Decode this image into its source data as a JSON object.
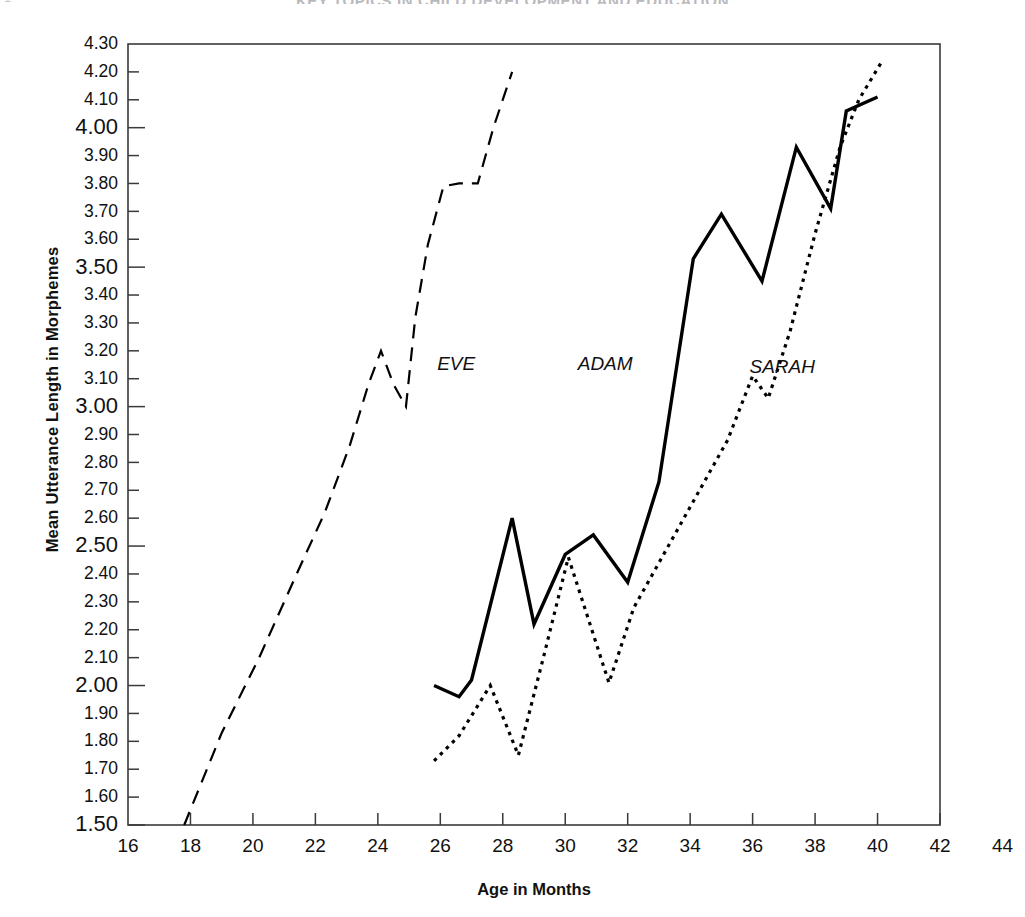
{
  "page": {
    "running_header": "KEY TOPICS IN CHILD DEVELOPMENT AND EDUCATION",
    "page_number": "1"
  },
  "chart_data": {
    "type": "line",
    "title": "",
    "xlabel": "Age in Months",
    "ylabel": "Mean Utterance Length in Morphemes",
    "xlim": [
      16,
      44
    ],
    "ylim": [
      1.5,
      4.3
    ],
    "grid": false,
    "legend_position": "inline-annotations",
    "x_ticks": [
      16,
      18,
      20,
      22,
      24,
      26,
      28,
      30,
      32,
      34,
      36,
      38,
      40,
      42,
      44
    ],
    "x_tick_labels": [
      "16",
      "18",
      "20",
      "22",
      "24",
      "26",
      "28",
      "30",
      "32",
      "34",
      "36",
      "38",
      "40",
      "42",
      "44"
    ],
    "y_ticks": [
      1.5,
      1.6,
      1.7,
      1.8,
      1.9,
      2.0,
      2.1,
      2.2,
      2.3,
      2.4,
      2.5,
      2.6,
      2.7,
      2.8,
      2.9,
      3.0,
      3.1,
      3.2,
      3.3,
      3.4,
      3.5,
      3.6,
      3.7,
      3.8,
      3.9,
      4.0,
      4.1,
      4.2,
      4.3
    ],
    "y_tick_labels": [
      "1.50",
      "1.60",
      "1.70",
      "1.80",
      "1.90",
      "2.00",
      "2.10",
      "2.20",
      "2.30",
      "2.40",
      "2.50",
      "2.60",
      "2.70",
      "2.80",
      "2.90",
      "3.00",
      "3.10",
      "3.20",
      "3.30",
      "3.40",
      "3.50",
      "3.60",
      "3.70",
      "3.80",
      "3.90",
      "4.00",
      "4.10",
      "4.20",
      "4.30"
    ],
    "y_major_labels": [
      "1.50",
      "2.00",
      "2.50",
      "3.00",
      "3.50",
      "4.00"
    ],
    "series": [
      {
        "name": "EVE",
        "style": "dashed",
        "color": "#000000",
        "label_x": 25.9,
        "label_y": 3.15,
        "x": [
          17.8,
          19.0,
          20.2,
          21.4,
          22.3,
          23.1,
          23.7,
          24.1,
          24.5,
          24.9,
          25.2,
          25.6,
          26.1,
          26.6,
          27.2,
          27.7,
          28.3
        ],
        "y": [
          1.5,
          1.83,
          2.1,
          2.4,
          2.62,
          2.86,
          3.08,
          3.2,
          3.08,
          3.0,
          3.32,
          3.58,
          3.79,
          3.8,
          3.8,
          4.0,
          4.2
        ]
      },
      {
        "name": "ADAM",
        "style": "solid",
        "color": "#000000",
        "label_x": 30.4,
        "label_y": 3.15,
        "x": [
          25.8,
          26.6,
          27.0,
          28.3,
          29.0,
          30.0,
          30.9,
          32.0,
          33.0,
          34.1,
          35.0,
          36.3,
          37.4,
          38.5,
          39.0,
          40.0
        ],
        "y": [
          2.0,
          1.96,
          2.02,
          2.6,
          2.22,
          2.47,
          2.54,
          2.37,
          2.73,
          3.53,
          3.69,
          3.45,
          3.93,
          3.71,
          4.06,
          4.11
        ]
      },
      {
        "name": "SARAH",
        "style": "dotted",
        "color": "#000000",
        "label_x": 35.9,
        "label_y": 3.14,
        "x": [
          25.8,
          26.6,
          27.6,
          28.5,
          29.3,
          30.1,
          31.4,
          32.2,
          33.1,
          34.2,
          35.2,
          36.0,
          36.5,
          37.2,
          38.0,
          38.8,
          39.4,
          40.1
        ],
        "y": [
          1.73,
          1.82,
          2.0,
          1.75,
          2.1,
          2.46,
          2.01,
          2.28,
          2.46,
          2.68,
          2.88,
          3.11,
          3.03,
          3.27,
          3.62,
          3.93,
          4.1,
          4.23
        ]
      }
    ]
  }
}
